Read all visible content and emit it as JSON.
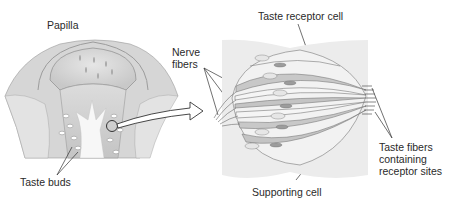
{
  "diagram": {
    "left_panel": {
      "label_papilla": "Papilla",
      "label_taste_buds": "Taste buds"
    },
    "right_panel": {
      "label_taste_receptor_cell": "Taste receptor cell",
      "label_nerve_fibers_line1": "Nerve",
      "label_nerve_fibers_line2": "fibers",
      "label_taste_fibers_line1": "Taste fibers",
      "label_taste_fibers_line2": "containing",
      "label_taste_fibers_line3": "receptor sites",
      "label_supporting_cell": "Supporting cell"
    },
    "colors": {
      "line": "#3a3a3a",
      "tissue_light": "#e8e8e8",
      "tissue_mid": "#cfcfcf",
      "tissue_dark": "#b5b5b5",
      "background": "#ffffff"
    }
  }
}
